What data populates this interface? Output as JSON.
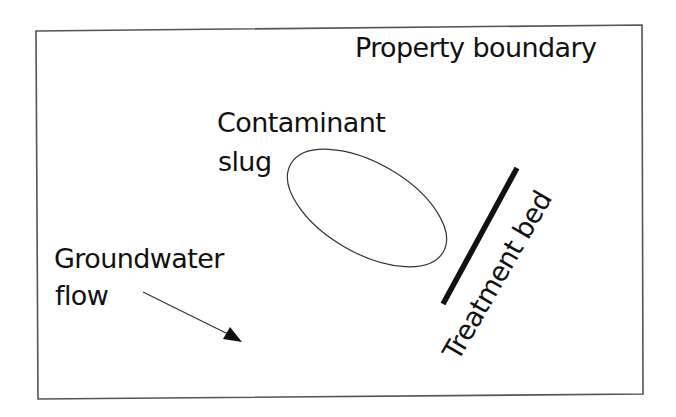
{
  "diagram": {
    "title": "",
    "labels": {
      "property_boundary": "Property boundary",
      "contaminant_line1": "Contaminant",
      "contaminant_line2": "slug",
      "groundwater_line1": "Groundwater",
      "groundwater_line2": "flow",
      "treatment_bed": "Treatment bed"
    },
    "elements": [
      {
        "id": "property-boundary",
        "shape": "rectangle",
        "label": "Property boundary"
      },
      {
        "id": "contaminant-slug",
        "shape": "ellipse",
        "label": "Contaminant slug"
      },
      {
        "id": "treatment-bed",
        "shape": "thick-line",
        "label": "Treatment bed"
      },
      {
        "id": "groundwater-flow",
        "shape": "arrow",
        "label": "Groundwater flow",
        "direction": "down-right"
      }
    ],
    "colors": {
      "stroke": "#222222",
      "background": "#ffffff",
      "text": "#111111"
    }
  }
}
